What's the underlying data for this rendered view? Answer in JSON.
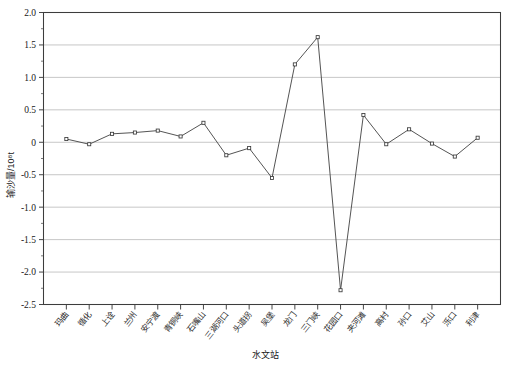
{
  "chart_data": {
    "type": "line",
    "title": "",
    "subtitle": "",
    "xlabel": "水文站",
    "ylabel": "输沙量/10⁸t",
    "ylim": [
      -2.5,
      2.0
    ],
    "ytick_step": 0.5,
    "grid": true,
    "legend": "none",
    "marker": "open-square",
    "categories": [
      "玛曲",
      "循化",
      "上诠",
      "兰州",
      "安宁渡",
      "青铜峡",
      "石嘴山",
      "三湖河口",
      "头道拐",
      "吴堡",
      "龙门",
      "三门峡",
      "花园口",
      "夹河滩",
      "高村",
      "孙口",
      "艾山",
      "泺口",
      "利津"
    ],
    "xtick_labels": [
      "玛曲",
      "循化",
      "上诠",
      "兰州",
      "安宁渡",
      "青铜峡",
      "石嘴山",
      "三湖河口",
      "头道拐",
      "吴堡",
      "龙门",
      "三门峡",
      "花园口",
      "夹河滩",
      "高村",
      "孙口",
      "艾山",
      "泺口",
      "利津"
    ],
    "values": [
      0.05,
      -0.03,
      0.13,
      0.15,
      0.18,
      0.09,
      0.3,
      -0.2,
      -0.09,
      -0.55,
      1.2,
      1.62,
      -2.28,
      0.42,
      -0.03,
      0.2,
      -0.02,
      -0.22,
      0.07
    ],
    "ytick_labels": [
      "2.0",
      "1.5",
      "1.0",
      "0.5",
      "0",
      "-0.5",
      "-1.0",
      "-1.5",
      "-2.0",
      "-2.5"
    ],
    "ytick_values": [
      2.0,
      1.5,
      1.0,
      0.5,
      0,
      -0.5,
      -1.0,
      -1.5,
      -2.0,
      -2.5
    ],
    "series": [
      {
        "name": "输沙量",
        "values": [
          0.05,
          -0.03,
          0.13,
          0.15,
          0.18,
          0.09,
          0.3,
          -0.2,
          -0.09,
          -0.55,
          1.2,
          1.62,
          -2.28,
          0.42,
          -0.03,
          0.2,
          -0.02,
          -0.22,
          0.07
        ]
      }
    ],
    "colors": {
      "line": "#4b4b4b",
      "marker_fill": "#ffffff",
      "marker_stroke": "#3a3a3a",
      "grid": "#b9b9b9",
      "frame": "#3d3d3d",
      "background": "#ffffff"
    }
  }
}
